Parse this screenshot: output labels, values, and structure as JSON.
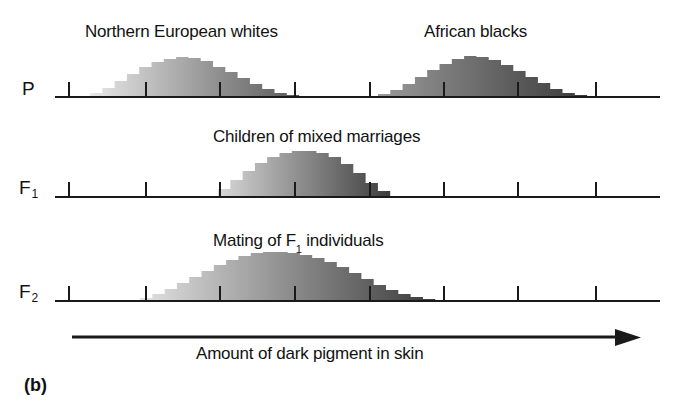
{
  "figure": {
    "panel_caption": "(b)",
    "axis_caption": "Amount of dark pigment in skin",
    "background_color": "#ffffff",
    "ink_color": "#1a1a1a"
  },
  "rows": [
    {
      "id": "P",
      "label": "P",
      "label_sub": "",
      "titles": [
        "Northern European whites",
        "African blacks"
      ]
    },
    {
      "id": "F1",
      "label": "F",
      "label_sub": "1",
      "titles": [
        "Children of mixed marriages"
      ]
    },
    {
      "id": "F2",
      "label": "F",
      "label_sub": "2",
      "titles": [
        "Mating of F₁ individuals"
      ]
    }
  ],
  "titles": {
    "p_left": "Northern European whites",
    "p_right": "African blacks",
    "f1": "Children of mixed marriages",
    "f2_pre": "Mating of F",
    "f2_sub": "1",
    "f2_post": " individuals"
  },
  "chart_data": {
    "type": "bar",
    "xlabel": "Amount of dark pigment in skin",
    "ylabel": "Frequency",
    "grid": false,
    "legend": "none",
    "axis_ticks_x": [
      69,
      146,
      220,
      295,
      370,
      444,
      518,
      596
    ],
    "axis_start_x": 55,
    "axis_end_x": 660,
    "bar_width": 12.3,
    "series": [
      {
        "name": "Northern European whites",
        "row": "P",
        "shade_start": "#e8e8e8",
        "shade_end": "#585858",
        "x0": 90,
        "values": [
          4,
          9,
          16,
          23,
          30,
          35,
          38,
          40,
          39,
          36,
          30,
          25,
          19,
          13,
          8,
          4,
          2
        ]
      },
      {
        "name": "African blacks",
        "row": "P",
        "shade_start": "#9a9a9a",
        "shade_end": "#3a3a3a",
        "x0": 378,
        "values": [
          3,
          7,
          13,
          20,
          27,
          33,
          38,
          41,
          40,
          37,
          32,
          26,
          20,
          14,
          8,
          4,
          2
        ]
      },
      {
        "name": "Children of mixed marriages",
        "row": "F1",
        "shade_start": "#d8d8d8",
        "shade_end": "#3c3c3c",
        "x0": 218,
        "values": [
          8,
          17,
          26,
          34,
          40,
          44,
          46,
          46,
          44,
          40,
          33,
          24,
          14,
          6
        ]
      },
      {
        "name": "Mating of F1 individuals",
        "row": "F2",
        "shade_start": "#e2e2e2",
        "shade_end": "#3a3a3a",
        "x0": 140,
        "values": [
          3,
          7,
          12,
          18,
          24,
          30,
          36,
          41,
          45,
          48,
          49,
          49,
          48,
          46,
          43,
          39,
          34,
          28,
          22,
          16,
          11,
          7,
          4,
          2
        ]
      }
    ]
  }
}
